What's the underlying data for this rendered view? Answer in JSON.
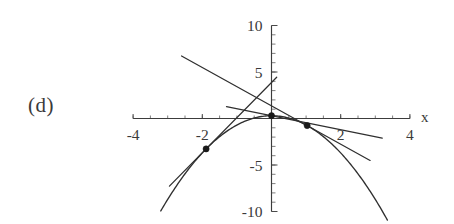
{
  "figure": {
    "part_label": "(d)",
    "background_color": "#ffffff",
    "ink_color": "#2f2f2f"
  },
  "chart_data": {
    "type": "line",
    "title": "",
    "xlabel": "x",
    "ylabel": "",
    "xlim": [
      -4,
      4
    ],
    "ylim": [
      -10,
      10
    ],
    "grid": false,
    "legend": null,
    "x_ticks": [
      -4,
      -2,
      2,
      4
    ],
    "x_tick_labels": [
      "-4",
      "-2",
      "2",
      "4"
    ],
    "y_ticks": [
      -10,
      -5,
      5,
      10
    ],
    "y_tick_labels": [
      "-10",
      "-5",
      "5",
      "10"
    ],
    "x_minor_tick_step": 0.5,
    "y_minor_tick_step": 1,
    "series": [
      {
        "name": "parabola",
        "kind": "curve",
        "equation": "y = 0.3 - x^2",
        "a": -1,
        "b": 0,
        "c": 0.3,
        "x_start": -3.2,
        "x_end": 3.35
      },
      {
        "name": "tangent-left",
        "kind": "tangent-line",
        "point": [
          -1.89,
          -3.27
        ],
        "slope": 3.78,
        "x_start": -2.95,
        "x_end": 0.15
      },
      {
        "name": "tangent-vertex",
        "kind": "tangent-line",
        "point": [
          0,
          0.3
        ],
        "slope": -0.75,
        "x_start": -1.3,
        "x_end": 3.2
      },
      {
        "name": "tangent-right",
        "kind": "tangent-line",
        "point": [
          1.03,
          -0.76
        ],
        "slope": -2.06,
        "x_start": -2.6,
        "x_end": 2.85
      }
    ],
    "marked_points": [
      {
        "label": "",
        "x": -1.89,
        "y": -3.27
      },
      {
        "label": "",
        "x": 0,
        "y": 0.3
      },
      {
        "label": "",
        "x": 1.03,
        "y": -0.76
      }
    ]
  }
}
